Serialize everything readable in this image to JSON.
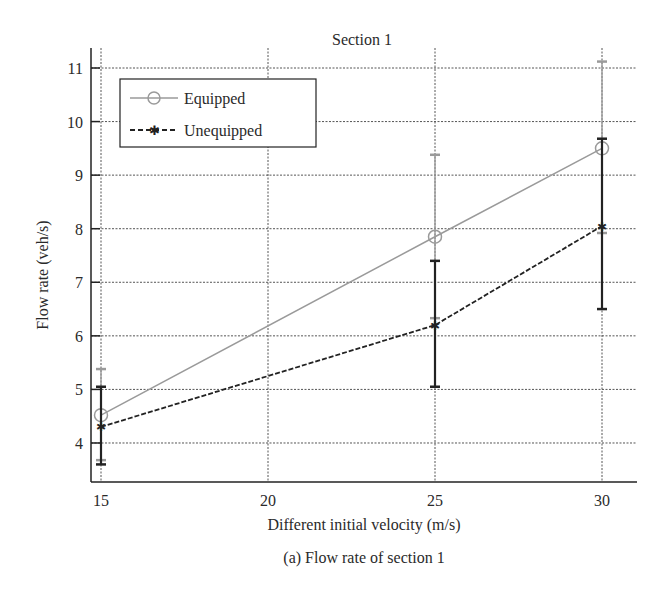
{
  "chart_data": {
    "type": "line",
    "title": "Section 1",
    "xlabel": "Different initial velocity (m/s)",
    "ylabel": "Flow rate (veh/s)",
    "caption": "(a) Flow rate of section 1",
    "x": [
      15,
      25,
      30
    ],
    "xticks": [
      15,
      20,
      25,
      30
    ],
    "yticks": [
      4,
      5,
      6,
      7,
      8,
      9,
      10,
      11
    ],
    "xlim": [
      14.4,
      31.1
    ],
    "ylim": [
      3.27,
      11.4
    ],
    "grid": true,
    "legend_position": "upper left",
    "series": [
      {
        "name": "Equipped",
        "style": "solid",
        "marker": "circle",
        "color": "#9a9a9a",
        "values": [
          4.52,
          7.85,
          9.5
        ],
        "error_low": [
          3.68,
          6.33,
          7.92
        ],
        "error_high": [
          5.38,
          9.38,
          11.12
        ]
      },
      {
        "name": "Unequipped",
        "style": "dashed",
        "marker": "star",
        "color": "#222222",
        "values": [
          4.3,
          6.2,
          8.05
        ],
        "error_low": [
          3.6,
          5.05,
          6.5
        ],
        "error_high": [
          5.05,
          7.4,
          9.68
        ]
      }
    ]
  }
}
